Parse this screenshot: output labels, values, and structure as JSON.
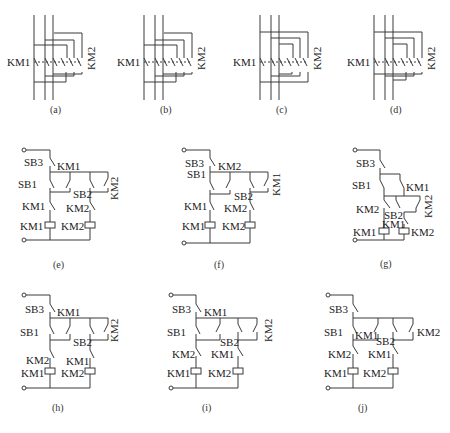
{
  "figure": {
    "panels": [
      {
        "id": "a",
        "caption": "(a)",
        "labels": [
          "KM1",
          "KM2"
        ]
      },
      {
        "id": "b",
        "caption": "(b)",
        "labels": [
          "KM1",
          "KM2"
        ]
      },
      {
        "id": "c",
        "caption": "(c)",
        "labels": [
          "KM1",
          "KM2"
        ]
      },
      {
        "id": "d",
        "caption": "(d)",
        "labels": [
          "KM1",
          "KM2"
        ]
      },
      {
        "id": "e",
        "caption": "(e)",
        "labels": [
          "SB3",
          "KM1",
          "SB1",
          "SB2",
          "KM2",
          "KM1",
          "KM2",
          "KM1",
          "KM2"
        ]
      },
      {
        "id": "f",
        "caption": "(f)",
        "labels": [
          "SB3",
          "KM2",
          "SB1",
          "SB2",
          "KM1",
          "KM1",
          "KM2",
          "KM1",
          "KM2"
        ]
      },
      {
        "id": "g",
        "caption": "(g)",
        "labels": [
          "SB3",
          "SB1",
          "KM1",
          "KM2",
          "SB2",
          "KM2",
          "KM1",
          "KM1",
          "KM2"
        ]
      },
      {
        "id": "h",
        "caption": "(h)",
        "labels": [
          "SB3",
          "KM1",
          "SB1",
          "SB2",
          "KM2",
          "KM2",
          "KM1",
          "KM1",
          "KM2"
        ]
      },
      {
        "id": "i",
        "caption": "(i)",
        "labels": [
          "SB3",
          "KM1",
          "SB1",
          "SB2",
          "KM2",
          "KM2",
          "KM1",
          "KM1",
          "KM2"
        ]
      },
      {
        "id": "j",
        "caption": "(j)",
        "labels": [
          "SB3",
          "SB1",
          "KM1",
          "SB2",
          "KM2",
          "KM2",
          "KM1",
          "KM1",
          "KM2"
        ]
      }
    ]
  }
}
